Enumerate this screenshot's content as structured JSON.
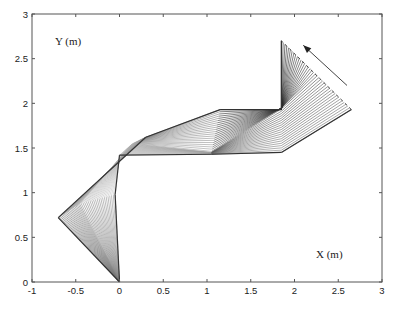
{
  "chart_data": {
    "type": "line",
    "title": "",
    "xlabel": "X (m)",
    "ylabel": "Y (m)",
    "xlim": [
      -1,
      3
    ],
    "ylim": [
      0,
      3
    ],
    "grid": false,
    "legend": null,
    "x_ticks": [
      -1,
      -0.5,
      0,
      0.5,
      1,
      1.5,
      2,
      2.5,
      3
    ],
    "x_tick_labels": [
      "-1",
      "-0.5",
      "0",
      "0.5",
      "1",
      "1.5",
      "2",
      "2.5",
      "3"
    ],
    "y_ticks": [
      0,
      0.5,
      1,
      1.5,
      2,
      2.5,
      3
    ],
    "y_tick_labels": [
      "0",
      "0.5",
      "1",
      "1.5",
      "2",
      "2.5",
      "3"
    ],
    "base": [
      0,
      0
    ],
    "n_frames": 40,
    "keyframes": [
      {
        "t": 0.0,
        "joints": [
          [
            0,
            0
          ],
          [
            -0.05,
            0.98
          ],
          [
            0.0,
            1.42
          ],
          [
            1.05,
            1.43
          ],
          [
            1.85,
            1.45
          ],
          [
            2.65,
            1.93
          ]
        ]
      },
      {
        "t": 0.5,
        "joints": [
          [
            0,
            0
          ],
          [
            -0.45,
            0.88
          ],
          [
            0.15,
            1.55
          ],
          [
            1.05,
            1.45
          ],
          [
            1.85,
            1.95
          ],
          [
            2.25,
            2.32
          ]
        ]
      },
      {
        "t": 1.0,
        "joints": [
          [
            0,
            0
          ],
          [
            -0.7,
            0.72
          ],
          [
            0.3,
            1.62
          ],
          [
            1.15,
            1.93
          ],
          [
            1.85,
            1.93
          ],
          [
            1.85,
            2.7
          ]
        ]
      }
    ],
    "end_effector_path": {
      "start": [
        2.65,
        1.93
      ],
      "end": [
        1.85,
        2.7
      ]
    },
    "arrow": {
      "from": [
        2.6,
        2.2
      ],
      "to": [
        2.1,
        2.65
      ],
      "label": ""
    }
  },
  "labels": {
    "x_axis": "X (m)",
    "y_axis": "Y (m)"
  },
  "colors": {
    "axes": "#555555",
    "link_light": "#b8b8b8",
    "link_dark": "#2a2a2a",
    "arrow": "#444444"
  }
}
